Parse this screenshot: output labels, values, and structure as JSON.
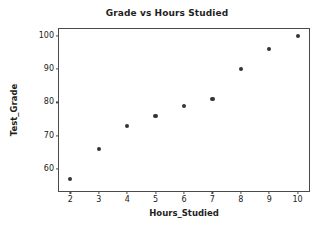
{
  "chart_data": {
    "type": "scatter",
    "title": "Grade vs Hours Studied",
    "xlabel": "Hours_Studied",
    "ylabel": "Test_Grade",
    "x": [
      2,
      3,
      4,
      5,
      6,
      7,
      8,
      9,
      10
    ],
    "values": [
      57,
      66,
      73,
      76,
      79,
      81,
      90,
      96,
      100
    ],
    "points": [
      {
        "x": 2,
        "y": 57
      },
      {
        "x": 3,
        "y": 66
      },
      {
        "x": 4,
        "y": 73
      },
      {
        "x": 5,
        "y": 76
      },
      {
        "x": 6,
        "y": 79
      },
      {
        "x": 7,
        "y": 81
      },
      {
        "x": 8,
        "y": 90
      },
      {
        "x": 9,
        "y": 96
      },
      {
        "x": 10,
        "y": 100
      }
    ],
    "xlim": [
      1.6,
      10.4
    ],
    "ylim": [
      53.5,
      102.0
    ],
    "xticks": [
      2,
      3,
      4,
      5,
      6,
      7,
      8,
      9,
      10
    ],
    "xtick_labels": [
      "2",
      "3",
      "4",
      "5",
      "6",
      "7",
      "8",
      "9",
      "10"
    ],
    "yticks": [
      60,
      70,
      80,
      90,
      100
    ],
    "ytick_labels": [
      "60",
      "70",
      "80",
      "90",
      "100"
    ],
    "grid": false,
    "legend": null,
    "marker": "circle",
    "marker_color": "#33333a",
    "spine_color": "#4a4a4a",
    "background": "#ffffff"
  }
}
